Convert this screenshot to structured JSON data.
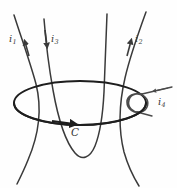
{
  "figure": {
    "kind": "physics-diagram",
    "topic": "amperian-loop-with-current-carrying-wires",
    "background_color": "#fefefe",
    "ink_color": "#3a3a3a",
    "loop_color": "#1e1e1e",
    "labels": {
      "i1": {
        "symbol": "i",
        "subscript": "1",
        "text": "i1"
      },
      "i3": {
        "symbol": "i",
        "subscript": "3",
        "text": "i3"
      },
      "i2": {
        "symbol": "i",
        "subscript": "2",
        "text": "i2"
      },
      "i4": {
        "symbol": "i",
        "subscript": "4",
        "text": "i4"
      },
      "c": {
        "text": "C"
      }
    },
    "elements": [
      {
        "name": "amperian-loop-c",
        "type": "ellipse",
        "label": "C",
        "direction": "counterclockwise-viewed-from-above",
        "arrow_on": "front-edge-pointing-right"
      },
      {
        "name": "wire-i1",
        "type": "curved-wire",
        "label": "i1",
        "current_direction": "upward",
        "passes_through_loop": true
      },
      {
        "name": "wire-i3",
        "type": "u-shaped-wire",
        "label": "i3",
        "current_direction": "downward",
        "passes_through_loop": true
      },
      {
        "name": "wire-i2",
        "type": "curved-wire",
        "label": "i2",
        "current_direction": "upward",
        "passes_through_loop": true
      },
      {
        "name": "wire-i4",
        "type": "coiled-wire",
        "label": "i4",
        "current_direction": "leftward",
        "passes_through_loop": false,
        "note": "loops around the right rim of the loop without enclosing it"
      }
    ]
  }
}
